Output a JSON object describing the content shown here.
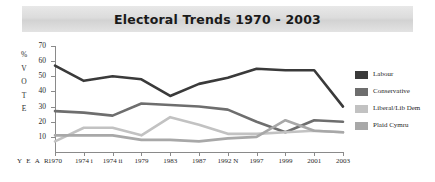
{
  "title": "Electoral Trends 1970 - 2003",
  "axis": {
    "year_word": "Y E A R",
    "vote_label_chars": [
      "%",
      "V",
      "O",
      "T",
      "E"
    ],
    "y_ticks": [
      70,
      60,
      50,
      40,
      30,
      20,
      10
    ]
  },
  "legend": [
    {
      "label": "Labour",
      "color": "#3a3a3a"
    },
    {
      "label": "Conservative",
      "color": "#6e6e6e"
    },
    {
      "label": "Liberal/Lib Dem",
      "color": "#c2c2c2"
    },
    {
      "label": "Plaid Cymru",
      "color": "#a8a8a8"
    }
  ],
  "chart_data": {
    "type": "line",
    "title": "Electoral Trends 1970 - 2003",
    "xlabel": "YEAR",
    "ylabel": "% VOTE",
    "ylim": [
      0,
      70
    ],
    "grid": false,
    "legend_position": "right",
    "categories": [
      "1970",
      "1974 i",
      "1974 ii",
      "1979",
      "1983",
      "1987",
      "1992 N",
      "1997",
      "1999",
      "2001",
      "2003"
    ],
    "series": [
      {
        "name": "Labour",
        "color": "#3a3a3a",
        "values": [
          57,
          47,
          50,
          48,
          37,
          45,
          49,
          55,
          54,
          54,
          30
        ]
      },
      {
        "name": "Conservative",
        "color": "#6e6e6e",
        "values": [
          27,
          26,
          24,
          32,
          31,
          30,
          28,
          20,
          13,
          21,
          20
        ]
      },
      {
        "name": "Liberal/Lib Dem",
        "color": "#c2c2c2",
        "values": [
          7,
          16,
          16,
          11,
          23,
          18,
          12,
          12,
          13,
          14,
          13
        ]
      },
      {
        "name": "Plaid Cymru",
        "color": "#a8a8a8",
        "values": [
          11,
          11,
          11,
          8,
          8,
          7,
          9,
          10,
          21,
          14,
          13
        ]
      }
    ]
  }
}
